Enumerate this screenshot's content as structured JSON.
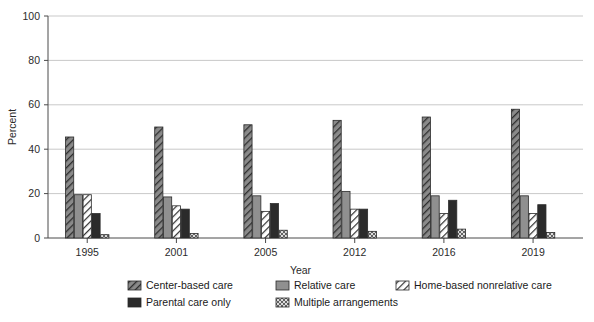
{
  "chart_data": {
    "type": "bar",
    "title": "",
    "subtitle": "",
    "xlabel": "Year",
    "ylabel": "Percent",
    "categories": [
      "1995",
      "2001",
      "2005",
      "2012",
      "2016",
      "2019"
    ],
    "ylim": [
      0,
      100
    ],
    "yticks": [
      0,
      20,
      40,
      60,
      80,
      100
    ],
    "ytick_labels": [
      "0",
      "20",
      "40",
      "60",
      "80",
      "100"
    ],
    "grid": "horizontal",
    "legend_position": "bottom",
    "series": [
      {
        "name": "Center-based care",
        "pattern": "diagonal-hatch-dark",
        "color": "#6e6e6e",
        "values": [
          45.5,
          50.0,
          51.0,
          53.0,
          54.5,
          58.0
        ]
      },
      {
        "name": "Relative care",
        "pattern": "solid-gray",
        "color": "#8d8d8d",
        "values": [
          19.5,
          18.5,
          19.0,
          21.0,
          19.0,
          19.0
        ]
      },
      {
        "name": "Home-based nonrelative care",
        "pattern": "diagonal-hatch-light",
        "color": "#ffffff",
        "values": [
          19.5,
          14.5,
          12.0,
          13.0,
          11.0,
          11.0
        ]
      },
      {
        "name": "Parental care only",
        "pattern": "solid-dark",
        "color": "#2b2b2b",
        "values": [
          11.0,
          13.0,
          15.5,
          13.0,
          17.0,
          15.0
        ]
      },
      {
        "name": "Multiple arrangements",
        "pattern": "cross-hatch",
        "color": "#d5d5d5",
        "values": [
          1.5,
          2.0,
          3.5,
          3.0,
          4.0,
          2.5
        ]
      }
    ]
  },
  "legend": {
    "items": [
      "Center-based care",
      "Relative care",
      "Home-based nonrelative care",
      "Parental care only",
      "Multiple arrangements"
    ]
  }
}
